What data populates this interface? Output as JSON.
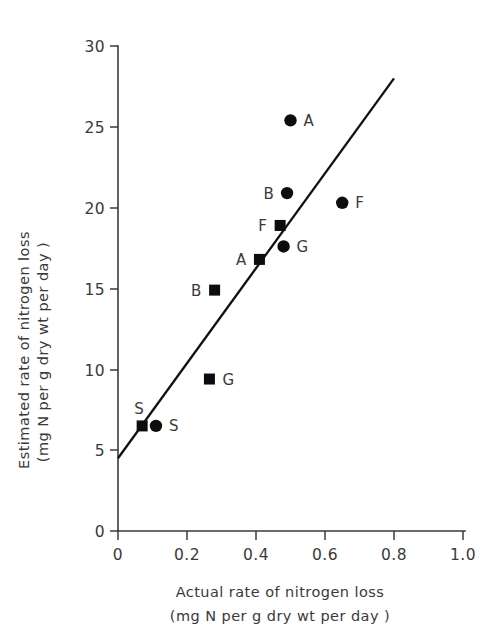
{
  "chart_data": {
    "type": "scatter",
    "title": "",
    "xlabel": "Actual rate of nitrogen loss",
    "xlabel_line2": "(mg N per g dry wt per day )",
    "ylabel": "Estimated rate of nitrogen loss",
    "ylabel_line2": "(mg N per g dry wt per day )",
    "xlim": [
      0,
      1.0
    ],
    "ylim": [
      0,
      30
    ],
    "xticks": [
      "0",
      "0.2",
      "0.4",
      "0.6",
      "0.8",
      "1.0"
    ],
    "xtick_values": [
      0,
      0.2,
      0.4,
      0.6,
      0.8,
      1.0
    ],
    "yticks": [
      "0",
      "5",
      "10",
      "15",
      "20",
      "25",
      "30"
    ],
    "ytick_values": [
      0,
      5,
      10,
      15,
      20,
      25,
      30
    ],
    "grid": false,
    "legend": "none",
    "series": [
      {
        "name": "circle-series",
        "marker": "circle",
        "color": "#0d0d0d",
        "points": [
          {
            "label": "A",
            "x": 0.5,
            "y": 25.4,
            "label_side": "right"
          },
          {
            "label": "B",
            "x": 0.49,
            "y": 20.9,
            "label_side": "left"
          },
          {
            "label": "F",
            "x": 0.65,
            "y": 20.3,
            "label_side": "right"
          },
          {
            "label": "G",
            "x": 0.48,
            "y": 17.6,
            "label_side": "right"
          },
          {
            "label": "S",
            "x": 0.11,
            "y": 6.5,
            "label_side": "right"
          }
        ]
      },
      {
        "name": "square-series",
        "marker": "square",
        "color": "#0d0d0d",
        "points": [
          {
            "label": "F",
            "x": 0.47,
            "y": 18.9,
            "label_side": "left"
          },
          {
            "label": "A",
            "x": 0.41,
            "y": 16.8,
            "label_side": "left"
          },
          {
            "label": "B",
            "x": 0.28,
            "y": 14.9,
            "label_side": "left"
          },
          {
            "label": "G",
            "x": 0.265,
            "y": 9.4,
            "label_side": "right"
          },
          {
            "label": "S",
            "x": 0.07,
            "y": 6.5,
            "label_side": "above-left"
          }
        ]
      }
    ],
    "fit_line": {
      "name": "regression-line",
      "x_start": 0.0,
      "y_start": 4.5,
      "x_end": 0.8,
      "y_end": 28.0
    }
  },
  "axes": {
    "x_axis_name": "x-axis",
    "y_axis_name": "y-axis"
  }
}
